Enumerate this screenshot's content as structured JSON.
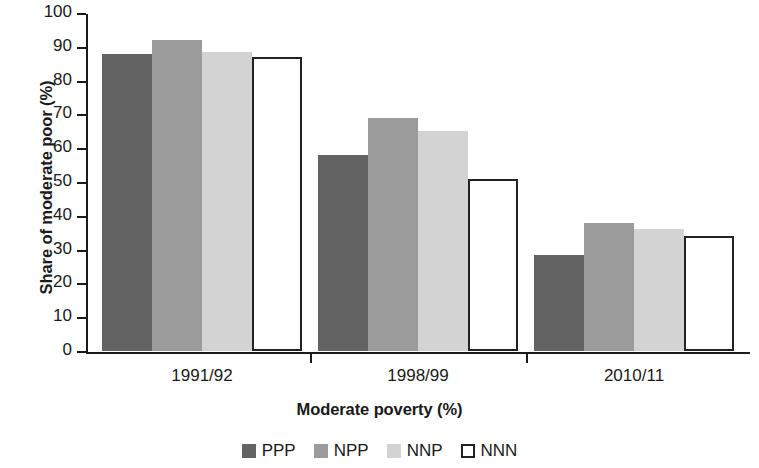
{
  "chart_data": {
    "type": "bar",
    "title": "",
    "xlabel": "Moderate poverty (%)",
    "ylabel": "Share of moderate poor (%)",
    "categories": [
      "1991/92",
      "1998/99",
      "2010/11"
    ],
    "series": [
      {
        "name": "PPP",
        "color": "#636363",
        "values": [
          88,
          58,
          28.5
        ]
      },
      {
        "name": "NPP",
        "color": "#9b9b9b",
        "values": [
          92,
          69,
          38
        ]
      },
      {
        "name": "NNP",
        "color": "#d3d3d3",
        "values": [
          88.5,
          65,
          36
        ]
      },
      {
        "name": "NNN",
        "color": "#ffffff",
        "values": [
          87,
          51,
          34
        ]
      }
    ],
    "ylim": [
      0,
      100
    ],
    "ytick_labels": [
      "0",
      "10",
      "20",
      "30",
      "40",
      "50",
      "60",
      "70",
      "80",
      "90",
      "100"
    ],
    "ytick_values": [
      0,
      10,
      20,
      30,
      40,
      50,
      60,
      70,
      80,
      90,
      100
    ],
    "grid": false,
    "legend_position": "bottom"
  }
}
